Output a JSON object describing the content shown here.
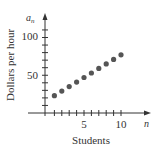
{
  "chart_data": {
    "type": "scatter",
    "title": "",
    "xlabel": "Students",
    "ylabel": "Dollars per hour",
    "x_axis_var": "n",
    "y_axis_var": "a_n",
    "x": [
      1,
      2,
      3,
      4,
      5,
      6,
      7,
      8,
      9,
      10
    ],
    "series": [
      {
        "name": "a_n",
        "values": [
          23,
          29,
          35,
          41,
          47,
          53,
          59,
          65,
          71,
          77
        ]
      }
    ],
    "xlim": [
      0,
      11
    ],
    "ylim": [
      0,
      120
    ],
    "x_ticks": [
      1,
      2,
      3,
      4,
      5,
      6,
      7,
      8,
      9,
      10
    ],
    "x_tick_labels": [
      "5",
      "10"
    ],
    "y_ticks": [
      10,
      20,
      30,
      40,
      50,
      60,
      70,
      80,
      90,
      100,
      110
    ],
    "y_tick_labels": [
      "50",
      "100"
    ],
    "grid": false,
    "legend": "none",
    "point_color": "#555555"
  },
  "labels": {
    "y_var": "a",
    "y_var_sub": "n",
    "x_var": "n",
    "ylabel": "Dollars per hour",
    "xlabel": "Students",
    "ytick_50": "50",
    "ytick_100": "100",
    "xtick_5": "5",
    "xtick_10": "10"
  }
}
